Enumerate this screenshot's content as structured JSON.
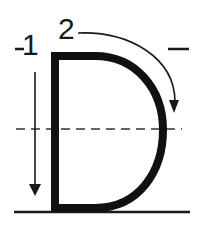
{
  "diagram": {
    "letter": "D",
    "strokes": [
      {
        "order": "1",
        "label": "1",
        "direction": "down",
        "description": "Vertical line from top to bottom"
      },
      {
        "order": "2",
        "label": "2",
        "direction": "clockwise-curve",
        "description": "Curve from top around to bottom"
      }
    ],
    "guide_lines": {
      "top_marker": "-",
      "midline": "dashed",
      "baseline": "solid"
    },
    "colors": {
      "stroke": "#111111",
      "background": "#ffffff"
    }
  }
}
